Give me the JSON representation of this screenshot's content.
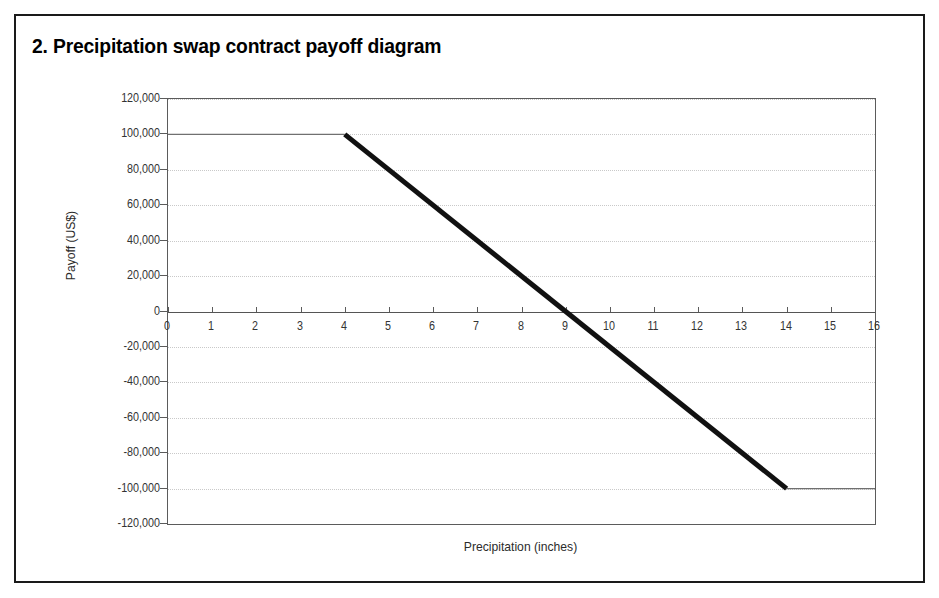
{
  "figure": {
    "number": "2.",
    "title": "2.  Precipitation swap contract payoff diagram"
  },
  "chart_data": {
    "type": "line",
    "title": "Precipitation swap contract payoff diagram",
    "xlabel": "Precipitation (inches)",
    "ylabel": "Payoff (US$)",
    "xlim": [
      0,
      16
    ],
    "ylim": [
      -120000,
      120000
    ],
    "grid": true,
    "legend": "none",
    "x_ticks": [
      0,
      1,
      2,
      3,
      4,
      5,
      6,
      7,
      8,
      9,
      10,
      11,
      12,
      13,
      14,
      15,
      16
    ],
    "x_tick_labels": [
      "0",
      "1",
      "2",
      "3",
      "4",
      "5",
      "6",
      "7",
      "8",
      "9",
      "10",
      "11",
      "12",
      "13",
      "14",
      "15",
      "16"
    ],
    "y_ticks": [
      120000,
      100000,
      80000,
      60000,
      40000,
      20000,
      0,
      -20000,
      -40000,
      -60000,
      -80000,
      -100000,
      -120000
    ],
    "y_tick_labels": [
      "120,000",
      "100,000",
      "80,000",
      "60,000",
      "40,000",
      "20,000",
      "0",
      "-20,000",
      "-40,000",
      "-60,000",
      "-80,000",
      "-100,000",
      "-120,000"
    ],
    "series": [
      {
        "name": "Payoff",
        "x": [
          0,
          4,
          14,
          16
        ],
        "values": [
          100000,
          100000,
          -100000,
          -100000
        ],
        "segments": [
          {
            "name": "cap-plateau",
            "x": [
              0,
              4
            ],
            "y": [
              100000,
              100000
            ],
            "emphasis": "thin"
          },
          {
            "name": "linear-payoff",
            "x": [
              4,
              14
            ],
            "y": [
              100000,
              -100000
            ],
            "emphasis": "thick"
          },
          {
            "name": "floor-plateau",
            "x": [
              14,
              16
            ],
            "y": [
              -100000,
              -100000
            ],
            "emphasis": "thin"
          }
        ],
        "zero_crossing_x": 9,
        "slope_per_inch": -20000
      }
    ],
    "annotations": []
  },
  "colors": {
    "frame": "#1a1a1a",
    "axis": "#5b5b5b",
    "grid": "#c9c9c9",
    "series_thick": "#111111",
    "series_thin": "#707070",
    "text": "#333333"
  }
}
